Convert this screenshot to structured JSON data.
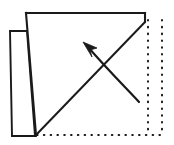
{
  "figure": {
    "background_color": "#ffffff",
    "ink_color": "#1a1a1a",
    "width": 174,
    "height": 145
  },
  "geometry": {
    "main_sheet": {
      "name": "folded-sheet",
      "points": "26,13 145,13 145,22 36,135 26,13",
      "top_left": [
        26,
        13
      ],
      "top_right": [
        145,
        13
      ],
      "right_notch": [
        145,
        22
      ],
      "bottom_left": [
        36,
        135
      ]
    },
    "left_flap": {
      "name": "left-flap",
      "points": "10,31 27,31 35,136 12,136 10,31",
      "top_left": [
        10,
        31
      ],
      "top_right": [
        27,
        31
      ],
      "bottom_right": [
        35,
        136
      ],
      "bottom_left": [
        12,
        136
      ]
    },
    "fold_diagonal": {
      "name": "diagonal-valley-fold",
      "from": [
        36,
        135
      ],
      "to": [
        145,
        22
      ]
    },
    "bottom_edge": {
      "name": "sheet-bottom-edge",
      "from": [
        12,
        136
      ],
      "to": [
        36,
        136
      ]
    },
    "ghost_outline": {
      "name": "original-square-ghost",
      "vertical_inner": {
        "x": 148,
        "y1": 20,
        "y2": 134
      },
      "vertical_outer": {
        "x": 162,
        "y1": 20,
        "y2": 134
      },
      "horizontal_bottom": {
        "y": 135,
        "x1": 37,
        "x2": 166
      }
    },
    "arrow": {
      "name": "fold-direction-arrow",
      "shaft": "M 139,102 C 126,88 108,70 88,47",
      "tip": [
        83,
        42
      ],
      "head_points": "83,42 97,48 90,50 92,57",
      "direction": "up-left"
    }
  },
  "labels": {
    "figure_caption": "",
    "step_number": ""
  }
}
